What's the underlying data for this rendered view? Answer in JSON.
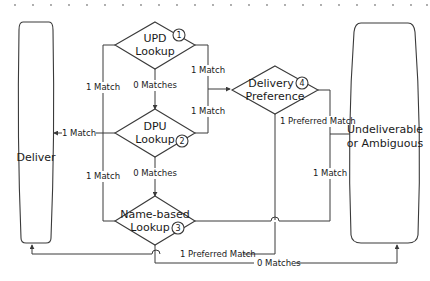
{
  "diagram": {
    "colors": {
      "stroke": "#3a3a3a",
      "text": "#1a1a1a",
      "background": "#ffffff",
      "dots": "#8a8a8a"
    },
    "terminals": {
      "deliver": {
        "label": "Deliver"
      },
      "undeliverable": {
        "line1": "Undeliverable",
        "line2": "or Ambiguous"
      }
    },
    "decisions": {
      "upd": {
        "line1": "UPD",
        "line2": "Lookup",
        "step": "1"
      },
      "dpu": {
        "line1": "DPU",
        "line2": "Lookup",
        "step": "2"
      },
      "name_based": {
        "line1": "Name-based",
        "line2": "Lookup",
        "step": "3"
      },
      "delivery_pref": {
        "line1": "Delivery",
        "line2": "Preference",
        "step": "4"
      }
    },
    "edges": {
      "upd_to_deliver": "1 Match",
      "upd_to_dpu": "0 Matches",
      "upd_to_pref": "1 Match",
      "dpu_to_deliver": "1 Match",
      "dpu_to_pref": "1 Match",
      "dpu_to_name": "0 Matches",
      "name_to_deliver_left": "1 Match",
      "name_to_pref_match": "1 Preferred Match",
      "name_zero": "0 Matches",
      "pref_to_undeliverable": "1 Preferred Match",
      "name_to_undeliverable_right": "1 Match"
    }
  }
}
